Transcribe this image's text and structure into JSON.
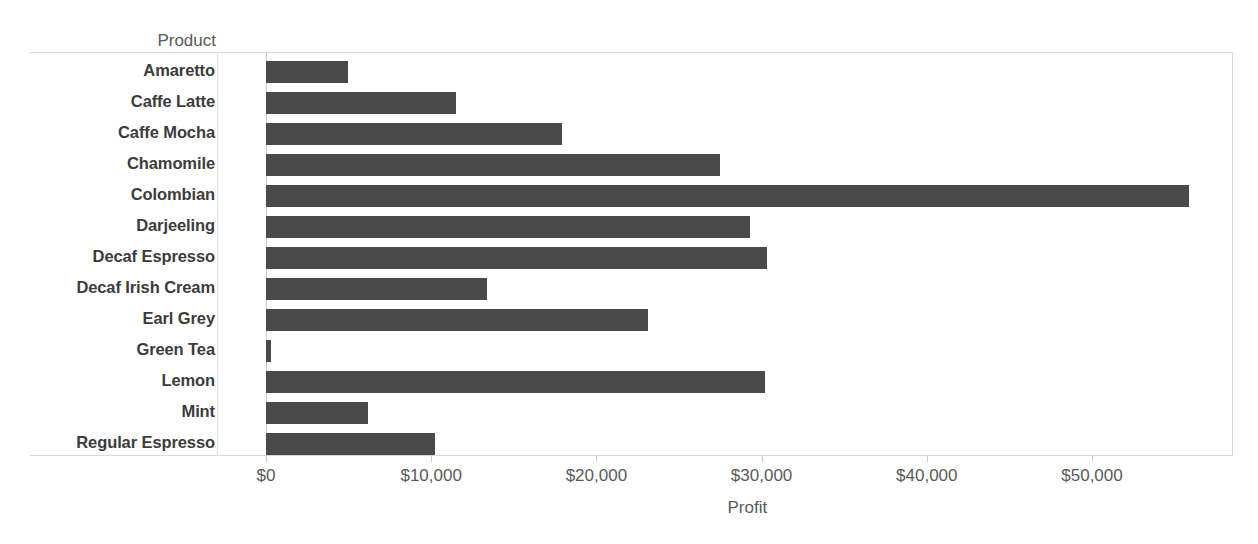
{
  "chart_data": {
    "type": "bar",
    "orientation": "horizontal",
    "title": "",
    "xlabel": "Profit",
    "ylabel": "Product",
    "categories": [
      "Amaretto",
      "Caffe Latte",
      "Caffe Mocha",
      "Chamomile",
      "Colombian",
      "Darjeeling",
      "Decaf Espresso",
      "Decaf Irish Cream",
      "Earl Grey",
      "Green Tea",
      "Lemon",
      "Mint",
      "Regular Espresso"
    ],
    "values": [
      4960,
      11500,
      17900,
      27500,
      55900,
      29300,
      30300,
      13400,
      23100,
      300,
      30200,
      6200,
      10200
    ],
    "value_format": "$#,##0",
    "xlim": [
      0,
      58500
    ],
    "xticks": [
      0,
      10000,
      20000,
      30000,
      40000,
      50000
    ],
    "xtick_labels": [
      "$0",
      "$10,000",
      "$20,000",
      "$30,000",
      "$40,000",
      "$50,000"
    ],
    "grid": false,
    "legend": "none",
    "bar_color": "#4a4a4a",
    "axis_color": "#d9d9d9",
    "label_color": "#3c3c3c",
    "tick_label_color": "#5a5a5a"
  },
  "axis": {
    "y_header": "Product",
    "x_title": "Profit"
  }
}
